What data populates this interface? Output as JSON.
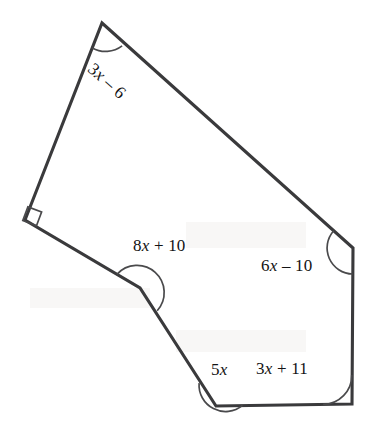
{
  "figure": {
    "kind": "polygon-angle-diagram",
    "shape_name": "hexagon",
    "stroke_color": "#3a3a3c",
    "arc_color": "#4a4a4c",
    "text_color": "#131314",
    "background_color": "#ffffff",
    "vertices": [
      {
        "name": "apex-top",
        "x": 102,
        "y": 23,
        "angle_mark": "arc"
      },
      {
        "name": "right",
        "x": 353,
        "y": 248,
        "angle_mark": "arc"
      },
      {
        "name": "bottom-right",
        "x": 352,
        "y": 404,
        "angle_mark": "arc"
      },
      {
        "name": "bottom-left",
        "x": 216,
        "y": 406,
        "angle_mark": "arc"
      },
      {
        "name": "reflex",
        "x": 140,
        "y": 288,
        "angle_mark": "reflex-arc"
      },
      {
        "name": "left-right-angle",
        "x": 25,
        "y": 220,
        "angle_mark": "square"
      }
    ],
    "labels": {
      "top_left": {
        "text": "3x – 6",
        "expr_prefix": "3",
        "var": "x",
        "expr_suffix": " – 6",
        "rotation_deg": 41.5,
        "at_vertex": "apex-top"
      },
      "reflex": {
        "text": "8x + 10",
        "expr_prefix": "8",
        "var": "x",
        "expr_suffix": " + 10",
        "rotation_deg": 0,
        "at_vertex": "reflex"
      },
      "right": {
        "text": "6x – 10",
        "expr_prefix": "6",
        "var": "x",
        "expr_suffix": " – 10",
        "rotation_deg": 0,
        "at_vertex": "right"
      },
      "bottom_left": {
        "text": "5x",
        "expr_prefix": "5",
        "var": "x",
        "expr_suffix": "",
        "rotation_deg": 0,
        "at_vertex": "bottom-left"
      },
      "bottom_right": {
        "text": "3x + 11",
        "expr_prefix": "3",
        "var": "x",
        "expr_suffix": " + 11",
        "rotation_deg": 0,
        "at_vertex": "bottom-right"
      }
    }
  }
}
